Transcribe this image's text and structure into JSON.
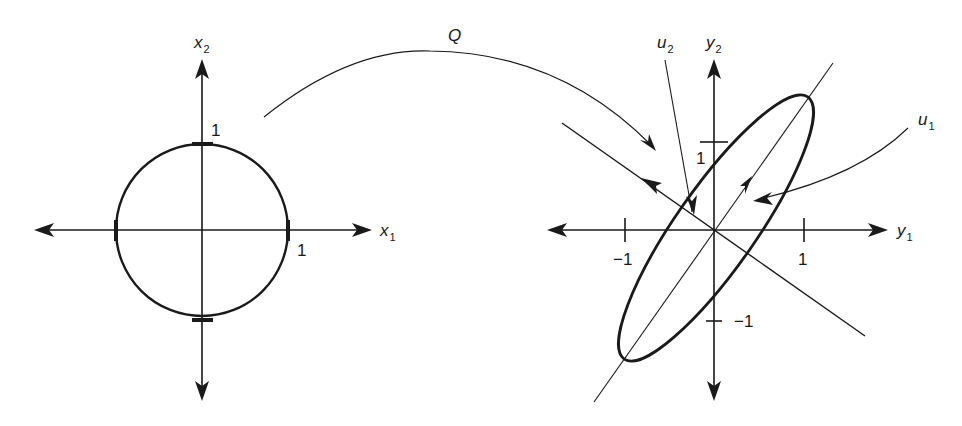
{
  "left_plot": {
    "x_axis_label": "x",
    "x_axis_sub": "1",
    "y_axis_label": "x",
    "y_axis_sub": "2",
    "tick_x_label": "1",
    "tick_y_label": "1",
    "shape": "unit circle"
  },
  "mapping": {
    "label": "Q"
  },
  "right_plot": {
    "x_axis_label": "y",
    "x_axis_sub": "1",
    "y_axis_label": "y",
    "y_axis_sub": "2",
    "tick_x_pos_label": "1",
    "tick_x_neg_label": "−1",
    "tick_y_pos_label": "1",
    "tick_y_neg_label": "−1",
    "u1_label": "u",
    "u1_sub": "1",
    "u2_label": "u",
    "u2_sub": "2",
    "shape": "ellipse"
  },
  "colors": {
    "ink": "#1a1a1a",
    "background": "#ffffff"
  }
}
